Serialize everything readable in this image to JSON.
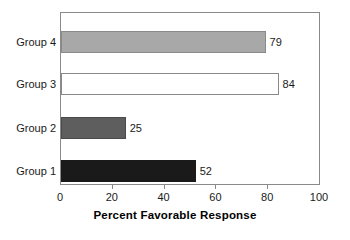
{
  "chart_data": {
    "type": "bar",
    "orientation": "horizontal",
    "title": "",
    "xlabel": "Percent Favorable Response",
    "ylabel": "",
    "xlim": [
      0,
      100
    ],
    "xticks": [
      0,
      20,
      40,
      60,
      80,
      100
    ],
    "grid": false,
    "legend": false,
    "categories": [
      "Group 1",
      "Group 2",
      "Group 3",
      "Group 4"
    ],
    "values": [
      52,
      25,
      84,
      79
    ],
    "value_labels": [
      "52",
      "25",
      "84",
      "79"
    ],
    "bar_colors": [
      "#1a1a1a",
      "#5e5e5e",
      "#ffffff",
      "#a8a8a8"
    ],
    "bar_border_colors": [
      "#1a1a1a",
      "#4a4a4a",
      "#8a8a8a",
      "#8a8a8a"
    ],
    "bars": [
      {
        "category": "Group 4",
        "value": 79,
        "label": "79",
        "fill": "#a8a8a8",
        "stroke": "#8a8a8a"
      },
      {
        "category": "Group 3",
        "value": 84,
        "label": "84",
        "fill": "#ffffff",
        "stroke": "#8a8a8a"
      },
      {
        "category": "Group 2",
        "value": 25,
        "label": "25",
        "fill": "#5e5e5e",
        "stroke": "#4a4a4a"
      },
      {
        "category": "Group 1",
        "value": 52,
        "label": "52",
        "fill": "#1a1a1a",
        "stroke": "#1a1a1a"
      }
    ]
  },
  "axis": {
    "tick_labels": [
      "0",
      "20",
      "40",
      "60",
      "80",
      "100"
    ],
    "title": "Percent Favorable Response"
  },
  "colors": {
    "frame": "#8a8a8a",
    "text": "#1a1a1a",
    "background": "#ffffff"
  }
}
